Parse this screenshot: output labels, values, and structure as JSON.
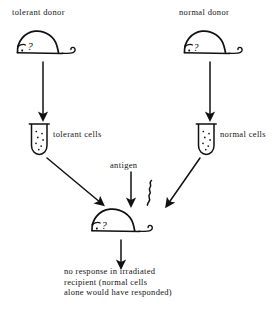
{
  "figure": {
    "background_color": "#ffffff",
    "ink_color": "#111111"
  },
  "labels": {
    "tolerant_donor": "tolerant donor",
    "normal_donor": "normal donor",
    "tolerant_cells": "tolerant cells",
    "normal_cells": "normal cells",
    "antigen": "antigen"
  },
  "caption": {
    "line1": "no response in irradiated",
    "line2": "recipient (normal cells",
    "line3": "alone would have responded)"
  },
  "icons": {
    "donor_mouse_left": "mouse-icon",
    "donor_mouse_right": "mouse-icon",
    "recipient_mouse": "mouse-icon",
    "tube_left": "test-tube-icon",
    "tube_right": "test-tube-icon",
    "antigen_squiggle": "squiggle-icon",
    "arrow_down_left": "arrow-down-icon",
    "arrow_down_right": "arrow-down-icon",
    "arrow_antigen": "arrow-down-icon",
    "arrow_diagonal_left": "arrow-diagonal-icon",
    "arrow_diagonal_right": "arrow-diagonal-icon",
    "arrow_result": "arrow-down-icon"
  }
}
